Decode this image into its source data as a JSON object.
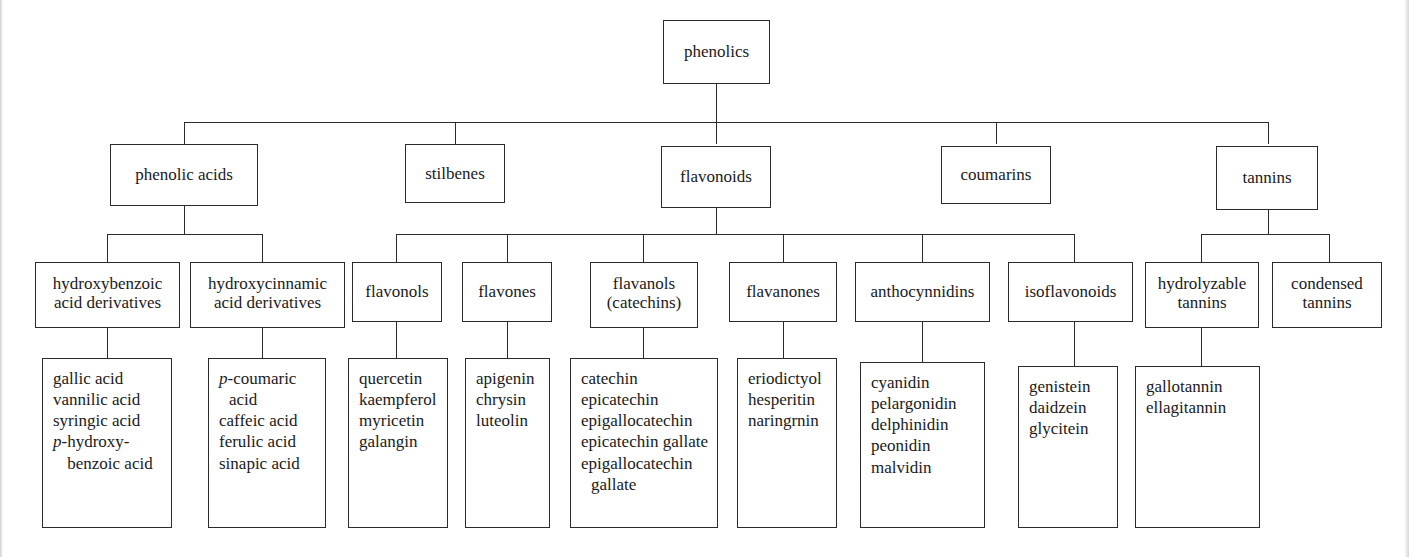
{
  "diagram": {
    "title_text": "phenolics",
    "root": {
      "label": "phenolics"
    },
    "classes": [
      {
        "label": "phenolic acids"
      },
      {
        "label": "stilbenes"
      },
      {
        "label": "flavonoids"
      },
      {
        "label": "coumarins"
      },
      {
        "label": "tannins"
      }
    ],
    "subclasses": [
      {
        "label": "hydroxybenzoic acid derivatives",
        "line1": "hydroxybenzoic",
        "line2": "acid derivatives"
      },
      {
        "label": "hydroxycinnamic acid derivatives",
        "line1": "hydroxycinnamic",
        "line2": "acid derivatives"
      },
      {
        "label": "flavonols",
        "line1": "flavonols",
        "line2": ""
      },
      {
        "label": "flavones",
        "line1": "flavones",
        "line2": ""
      },
      {
        "label": "flavanols (catechins)",
        "line1": "flavanols",
        "line2": "(catechins)"
      },
      {
        "label": "flavanones",
        "line1": "flavanones",
        "line2": ""
      },
      {
        "label": "anthocynnidins",
        "line1": "anthocynnidins",
        "line2": ""
      },
      {
        "label": "isoflavonoids",
        "line1": "isoflavonoids",
        "line2": ""
      },
      {
        "label": "hydrolyzable tannins",
        "line1": "hydrolyzable",
        "line2": "tannins"
      },
      {
        "label": "condensed tannins",
        "line1": "condensed",
        "line2": "tannins"
      }
    ],
    "compound_lists": [
      {
        "parent": "hydroxybenzoic acid derivatives",
        "items": [
          "gallic acid",
          "vannilic acid",
          "syringic acid",
          "p-hydroxybenzoic acid"
        ],
        "items_display": [
          {
            "italic_prefix": "",
            "text": "gallic acid"
          },
          {
            "italic_prefix": "",
            "text": "vannilic acid"
          },
          {
            "italic_prefix": "",
            "text": "syringic acid"
          },
          {
            "italic_prefix": "p",
            "text": "-hydroxy- benzoic acid"
          }
        ]
      },
      {
        "parent": "hydroxycinnamic acid derivatives",
        "items": [
          "p-coumaric acid",
          "caffeic acid",
          "ferulic acid",
          "sinapic acid"
        ],
        "items_display": [
          {
            "italic_prefix": "p",
            "text": "-coumaric acid"
          },
          {
            "italic_prefix": "",
            "text": "caffeic acid"
          },
          {
            "italic_prefix": "",
            "text": "ferulic acid"
          },
          {
            "italic_prefix": "",
            "text": "sinapic acid"
          }
        ]
      },
      {
        "parent": "flavonols",
        "items": [
          "quercetin",
          "kaempferol",
          "myricetin",
          "galangin"
        ],
        "items_display": [
          {
            "italic_prefix": "",
            "text": "quercetin"
          },
          {
            "italic_prefix": "",
            "text": "kaempferol"
          },
          {
            "italic_prefix": "",
            "text": "myricetin"
          },
          {
            "italic_prefix": "",
            "text": "galangin"
          }
        ]
      },
      {
        "parent": "flavones",
        "items": [
          "apigenin",
          "chrysin",
          "luteolin"
        ],
        "items_display": [
          {
            "italic_prefix": "",
            "text": "apigenin"
          },
          {
            "italic_prefix": "",
            "text": "chrysin"
          },
          {
            "italic_prefix": "",
            "text": "luteolin"
          }
        ]
      },
      {
        "parent": "flavanols (catechins)",
        "items": [
          "catechin",
          "epicatechin",
          "epigallocatechin",
          "epicatechin gallate",
          "epigallocatechin gallate"
        ],
        "items_display": [
          {
            "italic_prefix": "",
            "text": "catechin"
          },
          {
            "italic_prefix": "",
            "text": "epicatechin"
          },
          {
            "italic_prefix": "",
            "text": "epigallocatechin"
          },
          {
            "italic_prefix": "",
            "text": "epicatechin gallate"
          },
          {
            "italic_prefix": "",
            "text": "epigallocatechin gallate"
          }
        ]
      },
      {
        "parent": "flavanones",
        "items": [
          "eriodictyol",
          "hesperitin",
          "naringrnin"
        ],
        "items_display": [
          {
            "italic_prefix": "",
            "text": "eriodictyol"
          },
          {
            "italic_prefix": "",
            "text": "hesperitin"
          },
          {
            "italic_prefix": "",
            "text": "naringrnin"
          }
        ]
      },
      {
        "parent": "anthocynnidins",
        "items": [
          "cyanidin",
          "pelargonidin",
          "delphinidin",
          "peonidin",
          "malvidin"
        ],
        "items_display": [
          {
            "italic_prefix": "",
            "text": "cyanidin"
          },
          {
            "italic_prefix": "",
            "text": "pelargonidin"
          },
          {
            "italic_prefix": "",
            "text": "delphinidin"
          },
          {
            "italic_prefix": "",
            "text": "peonidin"
          },
          {
            "italic_prefix": "",
            "text": "malvidin"
          }
        ]
      },
      {
        "parent": "isoflavonoids",
        "items": [
          "genistein",
          "daidzein",
          "glycitein"
        ],
        "items_display": [
          {
            "italic_prefix": "",
            "text": "genistein"
          },
          {
            "italic_prefix": "",
            "text": "daidzein"
          },
          {
            "italic_prefix": "",
            "text": "glycitein"
          }
        ]
      },
      {
        "parent": "hydrolyzable tannins",
        "items": [
          "gallotannin",
          "ellagitannin"
        ],
        "items_display": [
          {
            "italic_prefix": "",
            "text": "gallotannin"
          },
          {
            "italic_prefix": "",
            "text": "ellagitannin"
          }
        ]
      }
    ],
    "colors": {
      "box_border": "#2b2b2b",
      "connector": "#2b2b2b",
      "text": "#1a1a1a",
      "background": "#ffffff"
    }
  }
}
